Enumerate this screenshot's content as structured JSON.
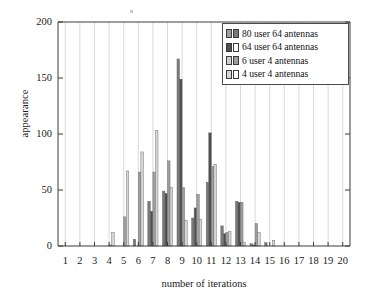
{
  "chart_data": {
    "type": "bar",
    "title": "",
    "subtitle": "",
    "xlabel": "number of iterations",
    "ylabel": "appearance",
    "xlim": [
      0.4,
      20.6
    ],
    "ylim": [
      0,
      200
    ],
    "yticks": [
      0,
      50,
      100,
      150,
      200
    ],
    "xticks": [
      1,
      2,
      3,
      4,
      5,
      6,
      7,
      8,
      9,
      10,
      11,
      12,
      13,
      14,
      15,
      16,
      17,
      18,
      19,
      20
    ],
    "grid": "vertical",
    "legend_position": "top-right",
    "categories": [
      1,
      2,
      3,
      4,
      5,
      6,
      7,
      8,
      9,
      10,
      11,
      12,
      13,
      14,
      15,
      16,
      17,
      18,
      19,
      20
    ],
    "series": [
      {
        "name": "80 user 64 antennas",
        "color": "#7a7a7a",
        "values": [
          0,
          0,
          0,
          0,
          0,
          6,
          40,
          49,
          167,
          25,
          57,
          18,
          40,
          2,
          3,
          0,
          0,
          0,
          0,
          0
        ]
      },
      {
        "name": "64 user 64 antennas",
        "color": "#4f4f4f",
        "values": [
          0,
          0,
          0,
          0,
          0,
          0,
          31,
          47,
          149,
          34,
          101,
          11,
          39,
          1,
          0,
          0,
          0,
          0,
          0,
          0
        ]
      },
      {
        "name": "6 user 4 antennas",
        "color": "#9e9e9e",
        "values": [
          0,
          0,
          0,
          1,
          26,
          66,
          66,
          76,
          52,
          46,
          71,
          12,
          39,
          20,
          0,
          0,
          0,
          0,
          0,
          0
        ]
      },
      {
        "name": "4 user 4 antennas",
        "color": "#d6d6d6",
        "values": [
          0,
          0,
          0,
          12,
          67,
          84,
          103,
          52,
          23,
          24,
          73,
          13,
          3,
          12,
          5,
          0,
          0,
          0,
          0,
          0
        ]
      }
    ]
  },
  "axes": {
    "ylabel": "appearance",
    "xlabel": "number of iterations",
    "ytick_labels": [
      "0",
      "50",
      "100",
      "150",
      "200"
    ],
    "xtick_labels": [
      "1",
      "2",
      "3",
      "4",
      "5",
      "6",
      "7",
      "8",
      "9",
      "10",
      "11",
      "12",
      "13",
      "14",
      "15",
      "16",
      "17",
      "18",
      "19",
      "20"
    ]
  },
  "legend": {
    "items": [
      {
        "label": "80 user 64 antennas"
      },
      {
        "label": "64 user 64 antennas"
      },
      {
        "label": "6 user 4 antennas"
      },
      {
        "label": "4 user 4 antennas"
      }
    ]
  },
  "colors": {
    "series_1": "#7a7a7a",
    "series_2": "#4f4f4f",
    "series_3": "#9e9e9e",
    "series_4": "#d6d6d6",
    "axis": "#3a3a3a",
    "grid": "#cfcfcf",
    "background": "#ffffff"
  }
}
